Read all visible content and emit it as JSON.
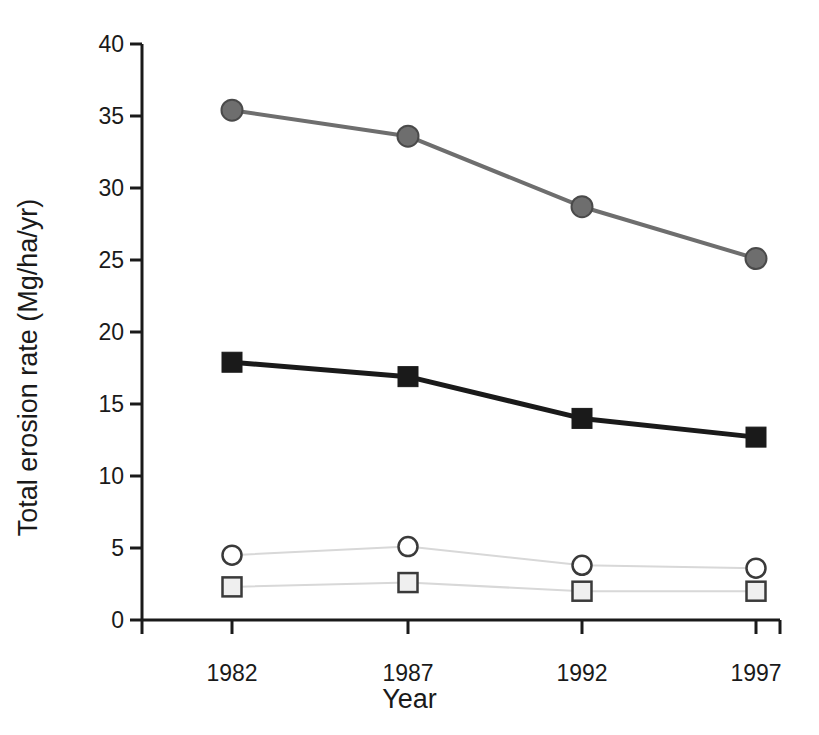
{
  "chart_data": {
    "type": "line",
    "title": "",
    "xlabel": "Year",
    "ylabel": "Total erosion rate (Mg/ha/yr)",
    "x": [
      1982,
      1987,
      1992,
      1997
    ],
    "categories": [
      "1982",
      "1987",
      "1992",
      "1997"
    ],
    "xtick_labels": [
      "1982",
      "1987",
      "1992",
      "1997"
    ],
    "ytick_labels": [
      "0",
      "5",
      "10",
      "15",
      "20",
      "25",
      "30",
      "35",
      "40"
    ],
    "yticks": [
      0,
      5,
      10,
      15,
      20,
      25,
      30,
      35,
      40
    ],
    "ylim": [
      0,
      40
    ],
    "xlim": [
      1980.5,
      1998.5
    ],
    "grid": false,
    "legend": "none",
    "series": [
      {
        "name": "gray-filled-circle-series",
        "marker": "circle-filled",
        "color": "#6e6e6e",
        "line_color": "#6e6e6e",
        "line_width": 4,
        "values": [
          35.4,
          33.6,
          28.7,
          25.1
        ]
      },
      {
        "name": "black-filled-square-series",
        "marker": "square-filled",
        "color": "#1a1a1a",
        "line_color": "#1a1a1a",
        "line_width": 5,
        "values": [
          17.9,
          16.9,
          14.0,
          12.7
        ]
      },
      {
        "name": "open-circle-series",
        "marker": "circle-open",
        "color": "#ffffff",
        "line_color": "#d8d8d8",
        "line_width": 2,
        "values": [
          4.5,
          5.1,
          3.8,
          3.6
        ]
      },
      {
        "name": "open-square-series",
        "marker": "square-open",
        "color": "#efefef",
        "line_color": "#d8d8d8",
        "line_width": 2,
        "values": [
          2.3,
          2.6,
          2.0,
          2.0
        ]
      }
    ]
  },
  "axes": {
    "y_title": "Total erosion rate (Mg/ha/yr)",
    "x_title": "Year",
    "axis_color": "#1a1a1a"
  }
}
